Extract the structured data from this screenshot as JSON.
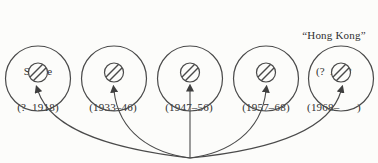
{
  "figure": {
    "background_color": "#fcfcfa",
    "line_color": "#4a4a4a",
    "text_color": "#2f2f2f"
  },
  "strains": [
    {
      "name": "Swine",
      "period": "(?  1918)"
    },
    {
      "name": "A₀",
      "period": "(1933–46)"
    },
    {
      "name": "A₁",
      "period": "(1947–56)"
    },
    {
      "name": "A₂",
      "period": "(1957–68)"
    },
    {
      "prefix": "“Hong Kong”",
      "name": "(?  A₃)*",
      "period": "(1968–      )"
    }
  ]
}
